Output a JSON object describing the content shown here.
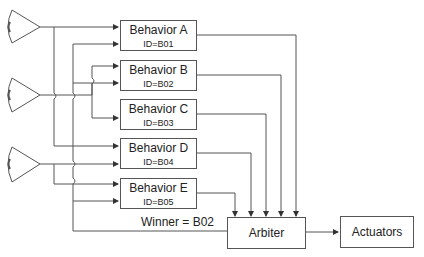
{
  "diagram": {
    "sensors": [
      {
        "id": "sensor-1",
        "icon": "eye-icon"
      },
      {
        "id": "sensor-2",
        "icon": "eye-icon"
      },
      {
        "id": "sensor-3",
        "icon": "eye-icon"
      }
    ],
    "behaviors": [
      {
        "name": "Behavior A",
        "id_label": "ID=B01"
      },
      {
        "name": "Behavior B",
        "id_label": "ID=B02"
      },
      {
        "name": "Behavior C",
        "id_label": "ID=B03"
      },
      {
        "name": "Behavior D",
        "id_label": "ID=B04"
      },
      {
        "name": "Behavior E",
        "id_label": "ID=B05"
      }
    ],
    "arbiter": {
      "label": "Arbiter"
    },
    "actuators": {
      "label": "Actuators"
    },
    "winner_label": "Winner = B02",
    "colors": {
      "line": "#555555",
      "text": "#222222",
      "background": "#ffffff"
    }
  }
}
